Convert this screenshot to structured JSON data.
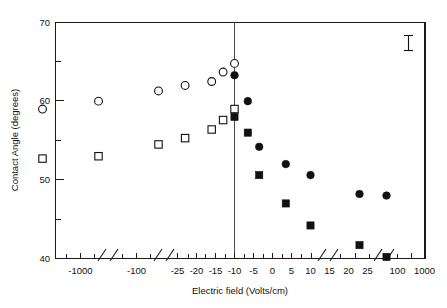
{
  "chart_data": {
    "type": "scatter",
    "title": "",
    "xlabel": "Electric field (Volts/cm)",
    "ylabel": "Contact Angle (degrees)",
    "ylim": [
      40,
      70
    ],
    "yticks": [
      40,
      50,
      60,
      70
    ],
    "yticks_minor": [
      45,
      55,
      65
    ],
    "ytick_labels": [
      "40",
      "50",
      "60",
      "70"
    ],
    "grid": false,
    "legend": "none",
    "axis_breaks": true,
    "x_axis_note": "broken log-like axis with segments: -1000, -100, linear -25..25, 100, 1000",
    "xtick_labels": [
      "-1000",
      "-100",
      "-25",
      "-20",
      "-15",
      "-10",
      "-5",
      "0",
      "5",
      "10",
      "15",
      "20",
      "25",
      "100",
      "1000"
    ],
    "xticks": [
      -1000,
      -100,
      -25,
      -20,
      -15,
      -10,
      -5,
      0,
      5,
      10,
      15,
      20,
      25,
      100,
      1000
    ],
    "series": [
      {
        "name": "open-circle",
        "marker": "open circle",
        "points": [
          {
            "x": -1000,
            "y": 59.0
          },
          {
            "x": -100,
            "y": 60.0
          },
          {
            "x": -20,
            "y": 61.3
          },
          {
            "x": -13,
            "y": 62.0
          },
          {
            "x": -6,
            "y": 62.5
          },
          {
            "x": -3,
            "y": 63.7
          },
          {
            "x": 0,
            "y": 64.8
          }
        ]
      },
      {
        "name": "open-square",
        "marker": "open square",
        "points": [
          {
            "x": -1000,
            "y": 52.7
          },
          {
            "x": -100,
            "y": 53.0
          },
          {
            "x": -20,
            "y": 54.5
          },
          {
            "x": -13,
            "y": 55.3
          },
          {
            "x": -6,
            "y": 56.4
          },
          {
            "x": -3,
            "y": 57.6
          },
          {
            "x": 0,
            "y": 59.0
          }
        ]
      },
      {
        "name": "filled-circle",
        "marker": "filled circle",
        "points": [
          {
            "x": 0,
            "y": 63.3
          },
          {
            "x": 3.5,
            "y": 60.0
          },
          {
            "x": 6.5,
            "y": 54.2
          },
          {
            "x": 13.5,
            "y": 52.0
          },
          {
            "x": 20,
            "y": 50.6
          },
          {
            "x": 100,
            "y": 48.2
          },
          {
            "x": 1000,
            "y": 48.0
          }
        ]
      },
      {
        "name": "filled-square",
        "marker": "filled square",
        "points": [
          {
            "x": 0,
            "y": 58.0
          },
          {
            "x": 3.5,
            "y": 56.0
          },
          {
            "x": 6.5,
            "y": 50.6
          },
          {
            "x": 13.5,
            "y": 47.0
          },
          {
            "x": 20,
            "y": 44.2
          },
          {
            "x": 100,
            "y": 41.7
          },
          {
            "x": 1000,
            "y": 40.2
          }
        ]
      }
    ],
    "annotations": [
      {
        "name": "error-bar",
        "type": "error-bar-key",
        "x_px": 408,
        "y_center": 66.1,
        "half_height": 1.0
      }
    ]
  },
  "axis": {
    "ylabel": "Contact Angle (degrees)",
    "xlabel": "Electric field (Volts/cm)",
    "ytick_0": "40",
    "ytick_1": "50",
    "ytick_2": "60",
    "ytick_3": "70",
    "xtick_0": "-1000",
    "xtick_1": "-100",
    "xtick_2": "-25",
    "xtick_3": "-20",
    "xtick_4": "-15",
    "xtick_5": "-10",
    "xtick_6": "-5",
    "xtick_7": "0",
    "xtick_8": "5",
    "xtick_9": "10",
    "xtick_10": "15",
    "xtick_11": "20",
    "xtick_12": "25",
    "xtick_13": "100",
    "xtick_14": "1000"
  },
  "colors": {
    "axis": "#1a1a1a",
    "marker_fill": "#111111",
    "marker_open": "#ffffff",
    "background": "#ffffff",
    "zero_line": "#4a4a4a"
  }
}
